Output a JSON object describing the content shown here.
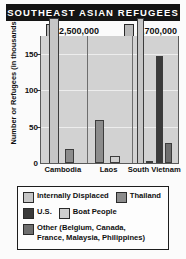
{
  "title": "SOUTHEAST ASIAN REFUGEES",
  "chart_data": {
    "type": "bar",
    "title": "SOUTHEAST ASIAN REFUGEES",
    "xlabel": "",
    "ylabel": "Number or Refugees (in thousands)",
    "ylim": [
      0,
      175
    ],
    "yticks": [
      50,
      100,
      150
    ],
    "ytick_labels": [
      "50",
      "100",
      "150"
    ],
    "grid": true,
    "legend_position": "bottom",
    "categories": [
      "Cambodia",
      "Laos",
      "South Vietnam"
    ],
    "series": [
      {
        "name": "Internally Displaced",
        "color": "#c6c6c6",
        "values": [
          2500,
          null,
          2700
        ]
      },
      {
        "name": "Thailand",
        "color": "#8c8c8c",
        "values": [
          19,
          59,
          3
        ]
      },
      {
        "name": "U.S.",
        "color": "#3a3a3a",
        "values": [
          null,
          null,
          147
        ]
      },
      {
        "name": "Boat People",
        "color": "#cfcfcf",
        "values": [
          null,
          9,
          null
        ]
      },
      {
        "name": "Other (Belgium, Canada, France, Malaysia, Philippines)",
        "color": "#6e6e6e",
        "values": [
          null,
          null,
          28
        ]
      }
    ],
    "truncated_bar_labels": [
      {
        "category": "Cambodia",
        "series": "Internally Displaced",
        "label": "2,500,000"
      },
      {
        "category": "South Vietnam",
        "series": "Internally Displaced",
        "label": "2,700,000"
      }
    ]
  },
  "callouts": [
    {
      "value": "2,500,000"
    },
    {
      "value": "2,700,000"
    }
  ],
  "axis": {
    "ylabel": "Number or Refugees (in thousands)",
    "yticks": [
      "150",
      "100",
      "50",
      "0"
    ],
    "xlabels": [
      "Cambodia",
      "Laos",
      "South Vietnam"
    ]
  },
  "legend": {
    "items": [
      {
        "label": "Internally Displaced",
        "color": "#c6c6c6"
      },
      {
        "label": "Thailand",
        "color": "#8c8c8c"
      },
      {
        "label": "U.S.",
        "color": "#3a3a3a"
      },
      {
        "label": "Boat People",
        "color": "#cfcfcf"
      },
      {
        "label": "Other (Belgium, Canada,",
        "label2": "France, Malaysia, Philippines)",
        "color": "#6e6e6e"
      }
    ]
  }
}
